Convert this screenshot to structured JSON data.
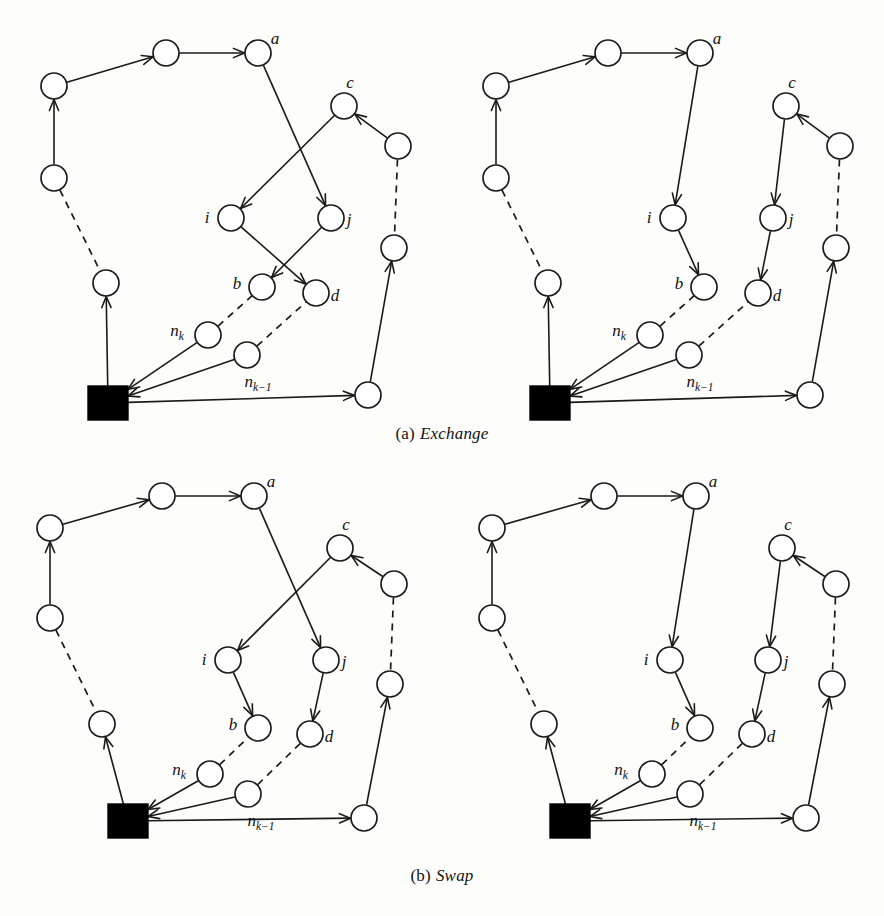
{
  "figure": {
    "background_color": "#fdfdfc",
    "ink_color": "#1a1a1a",
    "depot_color": "#000000",
    "node_fill": "#ffffff"
  },
  "captions": {
    "a": {
      "index": "(a)",
      "text": "Exchange"
    },
    "b": {
      "index": "(b)",
      "text": "Swap"
    }
  },
  "footer": {
    "text": ""
  },
  "labels": {
    "a": "a",
    "b": "b",
    "c": "c",
    "d": "d",
    "i": "i",
    "j": "j",
    "nk": "n",
    "nk_sub": "k",
    "nk1": "n",
    "nk1_sub": "k−1"
  },
  "panels": [
    {
      "id": "exchange-before",
      "row": "a",
      "side": "left",
      "title": "Exchange before",
      "depot": {
        "x": 88,
        "y": 378,
        "w": 40,
        "h": 34
      },
      "nodes": [
        {
          "id": "t1",
          "x": 54,
          "y": 78,
          "r": 13,
          "label": null
        },
        {
          "id": "t2",
          "x": 166,
          "y": 45,
          "r": 13,
          "label": null
        },
        {
          "id": "a",
          "x": 258,
          "y": 45,
          "r": 13,
          "label": "a",
          "label_dx": 17,
          "label_dy": -9
        },
        {
          "id": "l1",
          "x": 54,
          "y": 170,
          "r": 13,
          "label": null
        },
        {
          "id": "l2",
          "x": 106,
          "y": 275,
          "r": 13,
          "label": null
        },
        {
          "id": "c",
          "x": 344,
          "y": 98,
          "r": 13,
          "label": "c",
          "label_dx": 6,
          "label_dy": -18
        },
        {
          "id": "r1",
          "x": 398,
          "y": 138,
          "r": 13,
          "label": null
        },
        {
          "id": "r2",
          "x": 394,
          "y": 240,
          "r": 13,
          "label": null
        },
        {
          "id": "r3",
          "x": 368,
          "y": 387,
          "r": 13,
          "label": null
        },
        {
          "id": "i",
          "x": 231,
          "y": 210,
          "r": 13,
          "label": "i",
          "label_dx": -24,
          "label_dy": 5
        },
        {
          "id": "j",
          "x": 331,
          "y": 210,
          "r": 13,
          "label": "j",
          "label_dx": 18,
          "label_dy": 7
        },
        {
          "id": "b",
          "x": 262,
          "y": 279,
          "r": 13,
          "label": "b",
          "label_dx": -25,
          "label_dy": 2
        },
        {
          "id": "d",
          "x": 316,
          "y": 285,
          "r": 13,
          "label": "d",
          "label_dx": 19,
          "label_dy": 8
        },
        {
          "id": "nk",
          "x": 208,
          "y": 327,
          "r": 13,
          "label": "nk",
          "label_dx": -31,
          "label_dy": 1
        },
        {
          "id": "nk1",
          "x": 247,
          "y": 347,
          "r": 13,
          "label": "nk1",
          "label_dx": 11,
          "label_dy": 32
        }
      ],
      "edges": [
        {
          "from": "l1",
          "to": "t1",
          "style": "solid",
          "arrow": true
        },
        {
          "from": "t1",
          "to": "t2",
          "style": "solid",
          "arrow": true
        },
        {
          "from": "t2",
          "to": "a",
          "style": "solid",
          "arrow": true
        },
        {
          "from": "a",
          "to": "j",
          "style": "solid",
          "arrow": true
        },
        {
          "from": "c",
          "to": "i",
          "style": "solid",
          "arrow": true
        },
        {
          "from": "i",
          "to": "d",
          "style": "solid",
          "arrow": true
        },
        {
          "from": "j",
          "to": "b",
          "style": "solid",
          "arrow": true
        },
        {
          "from": "r1",
          "to": "c",
          "style": "solid",
          "arrow": true
        },
        {
          "from": "r1",
          "to": "r2",
          "style": "dashed",
          "arrow": false
        },
        {
          "from": "r3",
          "to": "r2",
          "style": "solid",
          "arrow": true
        },
        {
          "from": "depot",
          "to": "r3",
          "style": "solid",
          "arrow": true
        },
        {
          "from": "nk",
          "to": "depot",
          "style": "solid",
          "arrow": true
        },
        {
          "from": "nk1",
          "to": "depot",
          "style": "solid",
          "arrow": true
        },
        {
          "from": "nk",
          "to": "b",
          "style": "dashed",
          "arrow": false
        },
        {
          "from": "nk1",
          "to": "d",
          "style": "dashed",
          "arrow": false
        },
        {
          "from": "depot",
          "to": "l2",
          "style": "solid",
          "arrow": true
        },
        {
          "from": "l1",
          "to": "l2",
          "style": "dashed",
          "arrow": false
        }
      ]
    },
    {
      "id": "exchange-after",
      "row": "a",
      "side": "right",
      "title": "Exchange after",
      "depot": {
        "x": 88,
        "y": 378,
        "w": 40,
        "h": 34
      },
      "nodes": [
        {
          "id": "t1",
          "x": 54,
          "y": 78,
          "r": 13,
          "label": null
        },
        {
          "id": "t2",
          "x": 166,
          "y": 45,
          "r": 13,
          "label": null
        },
        {
          "id": "a",
          "x": 258,
          "y": 45,
          "r": 13,
          "label": "a",
          "label_dx": 17,
          "label_dy": -9
        },
        {
          "id": "l1",
          "x": 54,
          "y": 170,
          "r": 13,
          "label": null
        },
        {
          "id": "l2",
          "x": 106,
          "y": 275,
          "r": 13,
          "label": null
        },
        {
          "id": "c",
          "x": 344,
          "y": 98,
          "r": 13,
          "label": "c",
          "label_dx": 6,
          "label_dy": -18
        },
        {
          "id": "r1",
          "x": 398,
          "y": 138,
          "r": 13,
          "label": null
        },
        {
          "id": "r2",
          "x": 394,
          "y": 240,
          "r": 13,
          "label": null
        },
        {
          "id": "r3",
          "x": 368,
          "y": 387,
          "r": 13,
          "label": null
        },
        {
          "id": "i",
          "x": 231,
          "y": 210,
          "r": 13,
          "label": "i",
          "label_dx": -24,
          "label_dy": 5
        },
        {
          "id": "j",
          "x": 331,
          "y": 210,
          "r": 13,
          "label": "j",
          "label_dx": 18,
          "label_dy": 7
        },
        {
          "id": "b",
          "x": 262,
          "y": 279,
          "r": 13,
          "label": "b",
          "label_dx": -25,
          "label_dy": 2
        },
        {
          "id": "d",
          "x": 316,
          "y": 285,
          "r": 13,
          "label": "d",
          "label_dx": 19,
          "label_dy": 8
        },
        {
          "id": "nk",
          "x": 208,
          "y": 327,
          "r": 13,
          "label": "nk",
          "label_dx": -31,
          "label_dy": 1
        },
        {
          "id": "nk1",
          "x": 247,
          "y": 347,
          "r": 13,
          "label": "nk1",
          "label_dx": 11,
          "label_dy": 32
        }
      ],
      "edges": [
        {
          "from": "l1",
          "to": "t1",
          "style": "solid",
          "arrow": true
        },
        {
          "from": "t1",
          "to": "t2",
          "style": "solid",
          "arrow": true
        },
        {
          "from": "t2",
          "to": "a",
          "style": "solid",
          "arrow": true
        },
        {
          "from": "a",
          "to": "i",
          "style": "solid",
          "arrow": true
        },
        {
          "from": "i",
          "to": "b",
          "style": "solid",
          "arrow": true
        },
        {
          "from": "c",
          "to": "j",
          "style": "solid",
          "arrow": true
        },
        {
          "from": "j",
          "to": "d",
          "style": "solid",
          "arrow": true
        },
        {
          "from": "r1",
          "to": "c",
          "style": "solid",
          "arrow": true
        },
        {
          "from": "r1",
          "to": "r2",
          "style": "dashed",
          "arrow": false
        },
        {
          "from": "r3",
          "to": "r2",
          "style": "solid",
          "arrow": true
        },
        {
          "from": "depot",
          "to": "r3",
          "style": "solid",
          "arrow": true
        },
        {
          "from": "nk",
          "to": "depot",
          "style": "solid",
          "arrow": true
        },
        {
          "from": "nk1",
          "to": "depot",
          "style": "solid",
          "arrow": true
        },
        {
          "from": "nk",
          "to": "b",
          "style": "dashed",
          "arrow": false
        },
        {
          "from": "nk1",
          "to": "d",
          "style": "dashed",
          "arrow": false
        },
        {
          "from": "depot",
          "to": "l2",
          "style": "solid",
          "arrow": true
        },
        {
          "from": "l1",
          "to": "l2",
          "style": "dashed",
          "arrow": false
        }
      ]
    },
    {
      "id": "swap-before",
      "row": "b",
      "side": "left",
      "title": "Swap before",
      "depot": {
        "x": 108,
        "y": 338,
        "w": 40,
        "h": 34
      },
      "nodes": [
        {
          "id": "t1",
          "x": 50,
          "y": 62,
          "r": 13,
          "label": null
        },
        {
          "id": "t2",
          "x": 162,
          "y": 30,
          "r": 13,
          "label": null
        },
        {
          "id": "a",
          "x": 254,
          "y": 30,
          "r": 13,
          "label": "a",
          "label_dx": 17,
          "label_dy": -9
        },
        {
          "id": "l1",
          "x": 50,
          "y": 152,
          "r": 13,
          "label": null
        },
        {
          "id": "l2",
          "x": 102,
          "y": 258,
          "r": 13,
          "label": null
        },
        {
          "id": "c",
          "x": 340,
          "y": 82,
          "r": 13,
          "label": "c",
          "label_dx": 6,
          "label_dy": -18
        },
        {
          "id": "r1",
          "x": 394,
          "y": 118,
          "r": 13,
          "label": null
        },
        {
          "id": "r2",
          "x": 390,
          "y": 218,
          "r": 13,
          "label": null
        },
        {
          "id": "r3",
          "x": 364,
          "y": 352,
          "r": 13,
          "label": null
        },
        {
          "id": "i",
          "x": 228,
          "y": 194,
          "r": 13,
          "label": "i",
          "label_dx": -24,
          "label_dy": 5
        },
        {
          "id": "j",
          "x": 326,
          "y": 194,
          "r": 13,
          "label": "j",
          "label_dx": 18,
          "label_dy": 7
        },
        {
          "id": "b",
          "x": 258,
          "y": 262,
          "r": 13,
          "label": "b",
          "label_dx": -25,
          "label_dy": 2
        },
        {
          "id": "d",
          "x": 310,
          "y": 268,
          "r": 13,
          "label": "d",
          "label_dx": 19,
          "label_dy": 8
        },
        {
          "id": "nk",
          "x": 210,
          "y": 308,
          "r": 13,
          "label": "nk",
          "label_dx": -31,
          "label_dy": 1
        },
        {
          "id": "nk1",
          "x": 248,
          "y": 328,
          "r": 13,
          "label": "nk1",
          "label_dx": 13,
          "label_dy": 32
        }
      ],
      "edges": [
        {
          "from": "l1",
          "to": "t1",
          "style": "solid",
          "arrow": true
        },
        {
          "from": "t1",
          "to": "t2",
          "style": "solid",
          "arrow": true
        },
        {
          "from": "t2",
          "to": "a",
          "style": "solid",
          "arrow": true
        },
        {
          "from": "a",
          "to": "j",
          "style": "solid",
          "arrow": true
        },
        {
          "from": "c",
          "to": "i",
          "style": "solid",
          "arrow": true
        },
        {
          "from": "i",
          "to": "b",
          "style": "solid",
          "arrow": true
        },
        {
          "from": "j",
          "to": "d",
          "style": "solid",
          "arrow": true
        },
        {
          "from": "r1",
          "to": "c",
          "style": "solid",
          "arrow": true
        },
        {
          "from": "r1",
          "to": "r2",
          "style": "dashed",
          "arrow": false
        },
        {
          "from": "r3",
          "to": "r2",
          "style": "solid",
          "arrow": true
        },
        {
          "from": "depot",
          "to": "r3",
          "style": "solid",
          "arrow": true
        },
        {
          "from": "nk",
          "to": "depot",
          "style": "solid",
          "arrow": true
        },
        {
          "from": "nk1",
          "to": "depot",
          "style": "solid",
          "arrow": true
        },
        {
          "from": "nk",
          "to": "b",
          "style": "dashed",
          "arrow": false
        },
        {
          "from": "nk1",
          "to": "d",
          "style": "dashed",
          "arrow": false
        },
        {
          "from": "depot",
          "to": "l2",
          "style": "solid",
          "arrow": true
        },
        {
          "from": "l1",
          "to": "l2",
          "style": "dashed",
          "arrow": false
        }
      ]
    },
    {
      "id": "swap-after",
      "row": "b",
      "side": "right",
      "title": "Swap after",
      "depot": {
        "x": 108,
        "y": 338,
        "w": 40,
        "h": 34
      },
      "nodes": [
        {
          "id": "t1",
          "x": 50,
          "y": 62,
          "r": 13,
          "label": null
        },
        {
          "id": "t2",
          "x": 162,
          "y": 30,
          "r": 13,
          "label": null
        },
        {
          "id": "a",
          "x": 254,
          "y": 30,
          "r": 13,
          "label": "a",
          "label_dx": 17,
          "label_dy": -9
        },
        {
          "id": "l1",
          "x": 50,
          "y": 152,
          "r": 13,
          "label": null
        },
        {
          "id": "l2",
          "x": 102,
          "y": 258,
          "r": 13,
          "label": null
        },
        {
          "id": "c",
          "x": 340,
          "y": 82,
          "r": 13,
          "label": "c",
          "label_dx": 6,
          "label_dy": -18
        },
        {
          "id": "r1",
          "x": 394,
          "y": 118,
          "r": 13,
          "label": null
        },
        {
          "id": "r2",
          "x": 390,
          "y": 218,
          "r": 13,
          "label": null
        },
        {
          "id": "r3",
          "x": 364,
          "y": 352,
          "r": 13,
          "label": null
        },
        {
          "id": "i",
          "x": 228,
          "y": 194,
          "r": 13,
          "label": "i",
          "label_dx": -24,
          "label_dy": 5
        },
        {
          "id": "j",
          "x": 326,
          "y": 194,
          "r": 13,
          "label": "j",
          "label_dx": 18,
          "label_dy": 7
        },
        {
          "id": "b",
          "x": 258,
          "y": 262,
          "r": 13,
          "label": "b",
          "label_dx": -25,
          "label_dy": 2
        },
        {
          "id": "d",
          "x": 310,
          "y": 268,
          "r": 13,
          "label": "d",
          "label_dx": 19,
          "label_dy": 8
        },
        {
          "id": "nk",
          "x": 210,
          "y": 308,
          "r": 13,
          "label": "nk",
          "label_dx": -31,
          "label_dy": 1
        },
        {
          "id": "nk1",
          "x": 248,
          "y": 328,
          "r": 13,
          "label": "nk1",
          "label_dx": 13,
          "label_dy": 32
        }
      ],
      "edges": [
        {
          "from": "l1",
          "to": "t1",
          "style": "solid",
          "arrow": true
        },
        {
          "from": "t1",
          "to": "t2",
          "style": "solid",
          "arrow": true
        },
        {
          "from": "t2",
          "to": "a",
          "style": "solid",
          "arrow": true
        },
        {
          "from": "a",
          "to": "i",
          "style": "solid",
          "arrow": true
        },
        {
          "from": "i",
          "to": "b",
          "style": "solid",
          "arrow": true
        },
        {
          "from": "c",
          "to": "j",
          "style": "solid",
          "arrow": true
        },
        {
          "from": "j",
          "to": "d",
          "style": "solid",
          "arrow": true
        },
        {
          "from": "r1",
          "to": "c",
          "style": "solid",
          "arrow": true
        },
        {
          "from": "r1",
          "to": "r2",
          "style": "dashed",
          "arrow": false
        },
        {
          "from": "r3",
          "to": "r2",
          "style": "solid",
          "arrow": true
        },
        {
          "from": "depot",
          "to": "r3",
          "style": "solid",
          "arrow": true
        },
        {
          "from": "nk",
          "to": "depot",
          "style": "solid",
          "arrow": true
        },
        {
          "from": "nk1",
          "to": "depot",
          "style": "solid",
          "arrow": true
        },
        {
          "from": "nk",
          "to": "b",
          "style": "dashed",
          "arrow": false
        },
        {
          "from": "nk1",
          "to": "d",
          "style": "dashed",
          "arrow": false
        },
        {
          "from": "depot",
          "to": "l2",
          "style": "solid",
          "arrow": true
        },
        {
          "from": "l1",
          "to": "l2",
          "style": "dashed",
          "arrow": false
        }
      ]
    }
  ]
}
